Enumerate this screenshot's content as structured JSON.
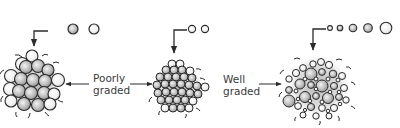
{
  "labels": {
    "poorly_graded_line1": "Poorly",
    "poorly_graded_line2": "graded",
    "well_graded_line1": "Well",
    "well_graded_line2": "graded"
  },
  "colors": {
    "stroke": "#2b2b2b",
    "fill_light": "#ffffff",
    "fill_mid": "#bdbdbd",
    "fill_dark": "#8e8e8e",
    "text": "#3a3a3a"
  },
  "clusters": [
    {
      "name": "single-size-cluster",
      "cx": 34,
      "cy": 86,
      "particle_size": "uniform large"
    },
    {
      "name": "two-size-cluster",
      "cx": 178,
      "cy": 88,
      "particle_size": "uniform small"
    },
    {
      "name": "well-graded-cluster",
      "cx": 318,
      "cy": 86,
      "particle_size": "mixed sizes"
    }
  ],
  "legend_particles": [
    {
      "group": "poorly-graded-large",
      "sizes": [
        5,
        5
      ]
    },
    {
      "group": "poorly-graded-small",
      "sizes": [
        4,
        4
      ]
    },
    {
      "group": "well-graded-mixed",
      "sizes": [
        2.5,
        3,
        4,
        4.5,
        6
      ]
    }
  ]
}
